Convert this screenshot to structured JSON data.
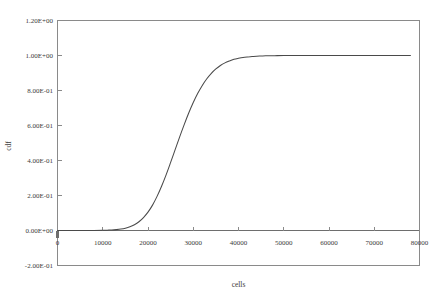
{
  "chart_data": {
    "type": "line",
    "title": "",
    "xlabel": "cells",
    "ylabel": "cdf",
    "xlim": [
      0,
      80000
    ],
    "ylim": [
      -0.2,
      1.2
    ],
    "grid": false,
    "legend": null,
    "x_ticks": [
      0,
      10000,
      20000,
      30000,
      40000,
      50000,
      60000,
      70000,
      80000
    ],
    "x_tick_labels": [
      "0",
      "10000",
      "20000",
      "30000",
      "40000",
      "50000",
      "60000",
      "70000",
      "80000"
    ],
    "y_ticks": [
      -0.2,
      0,
      0.2,
      0.4,
      0.6,
      0.8,
      1.0,
      1.2
    ],
    "y_tick_labels": [
      "-2.00E-01",
      "0.00E+00",
      "2.00E-01",
      "4.00E-01",
      "6.00E-01",
      "8.00E-01",
      "1.00E+00",
      "1.20E+00"
    ],
    "series": [
      {
        "name": "cdf",
        "color": "#4a4a4a",
        "x": [
          0,
          2000,
          4000,
          6000,
          8000,
          10000,
          11000,
          12000,
          13000,
          14000,
          15000,
          16000,
          17000,
          18000,
          19000,
          20000,
          21000,
          22000,
          23000,
          24000,
          25000,
          26000,
          27000,
          28000,
          29000,
          30000,
          31000,
          32000,
          33000,
          34000,
          35000,
          36000,
          37000,
          38000,
          39000,
          40000,
          41000,
          42000,
          43000,
          44000,
          45000,
          46000,
          48000,
          50000,
          55000,
          60000,
          65000,
          70000,
          75000,
          78000
        ],
        "y": [
          0.0,
          0.0,
          0.0,
          0.0,
          0.0,
          0.001,
          0.002,
          0.003,
          0.005,
          0.008,
          0.013,
          0.021,
          0.033,
          0.05,
          0.074,
          0.105,
          0.145,
          0.195,
          0.253,
          0.318,
          0.389,
          0.462,
          0.535,
          0.605,
          0.671,
          0.731,
          0.784,
          0.829,
          0.867,
          0.898,
          0.923,
          0.943,
          0.958,
          0.969,
          0.978,
          0.984,
          0.989,
          0.992,
          0.994,
          0.996,
          0.997,
          0.998,
          0.999,
          0.9995,
          0.9999,
          1.0,
          1.0,
          1.0,
          1.0,
          1.0
        ]
      }
    ]
  },
  "axes": {
    "x_title": "cells",
    "y_title": "cdf"
  }
}
